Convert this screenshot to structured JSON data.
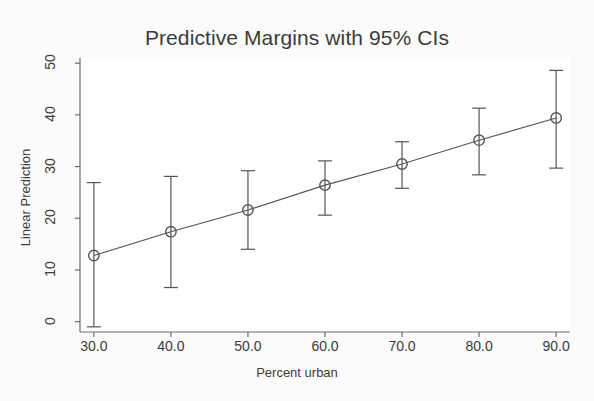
{
  "chart_data": {
    "type": "line",
    "title": "Predictive Margins with 95% CIs",
    "xlabel": "Percent urban",
    "ylabel": "Linear Prediction",
    "xlim": [
      28.2,
      91.8
    ],
    "ylim": [
      -2.0,
      51.0
    ],
    "grid": false,
    "legend": null,
    "xticks": [
      30,
      40,
      50,
      60,
      70,
      80,
      90
    ],
    "xtick_labels": [
      "30.0",
      "40.0",
      "50.0",
      "60.0",
      "70.0",
      "80.0",
      "90.0"
    ],
    "yticks": [
      0,
      10,
      20,
      30,
      40,
      50
    ],
    "ytick_labels": [
      "0",
      "10",
      "20",
      "30",
      "40",
      "50"
    ],
    "x": [
      30,
      40,
      50,
      60,
      70,
      80,
      90
    ],
    "values": [
      12.8,
      17.4,
      21.6,
      26.4,
      30.5,
      35.1,
      39.4
    ],
    "ci_lower": [
      -1.0,
      6.6,
      14.0,
      20.6,
      25.8,
      28.4,
      29.7
    ],
    "ci_upper": [
      26.9,
      28.1,
      29.2,
      31.1,
      34.8,
      41.3,
      48.6
    ],
    "marker": "circle-open",
    "marker_color": "#555555",
    "line_color": "#555555",
    "errorbar_color": "#555555",
    "background_color": "#fbfbfb",
    "plot_background_color": "#ffffff"
  }
}
